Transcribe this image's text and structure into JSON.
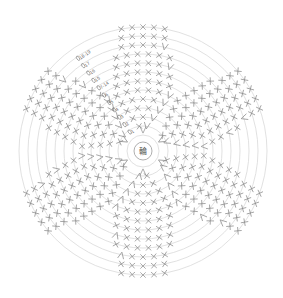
{
  "diagram": {
    "type": "crochet-round-chart",
    "center": {
      "x": 143,
      "y": 151,
      "label": "輪",
      "meaning": "magic ring"
    },
    "rings": {
      "count": 13,
      "inner_radius": 16,
      "outer_radius": 124
    },
    "colors": {
      "ring": "#d9d9d9",
      "stitch": "#8a8a8a",
      "label": "#666666",
      "background": "#ffffff"
    },
    "round_labels": [
      {
        "text": "1",
        "ring": 1
      },
      {
        "text": "2",
        "ring": 2
      },
      {
        "text": "3",
        "ring": 3
      },
      {
        "text": "4",
        "ring": 4
      },
      {
        "text": "5",
        "ring": 5
      },
      {
        "text": "6",
        "ring": 6
      },
      {
        "text": "7-14",
        "ring": 7
      },
      {
        "text": "15",
        "ring": 8
      },
      {
        "text": "16",
        "ring": 9
      },
      {
        "text": "17",
        "ring": 10
      },
      {
        "text": "18-19",
        "ring": 11
      }
    ],
    "label_angle_deg": -125,
    "wedges": 6,
    "wedge_start_angle_deg": -90,
    "stitch_legend": [
      {
        "symbol": "X",
        "name": "single crochet"
      },
      {
        "symbol": "V",
        "name": "increase (2 sc in one stitch)"
      }
    ],
    "stitches_per_wedge_by_ring": [
      1,
      2,
      3,
      4,
      5,
      6,
      6,
      6,
      6,
      6,
      5,
      5,
      5
    ]
  }
}
